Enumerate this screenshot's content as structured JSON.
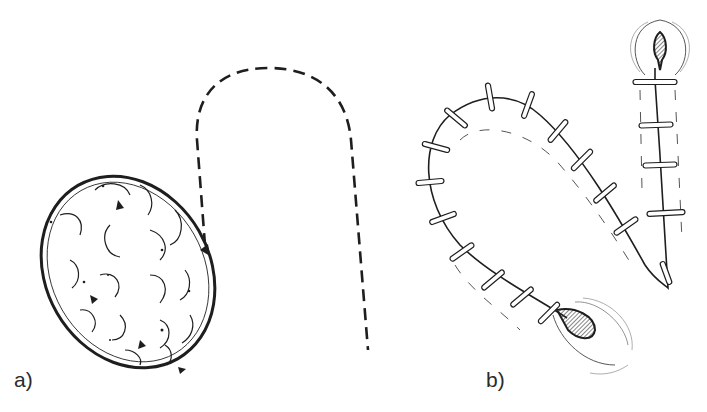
{
  "figure": {
    "panels": [
      {
        "id": "a",
        "label": "a)",
        "description": "Oval cyst/lesion with lobulated texture beside a dashed U-shaped incision outline"
      },
      {
        "id": "b",
        "label": "b)",
        "description": "Closed curved incision with interrupted sutures and two drainage openings"
      }
    ],
    "suture_count_curve": 15,
    "suture_count_straight": 4,
    "colors": {
      "ink": "#1e1e1e",
      "background": "#ffffff",
      "hatch": "#333333"
    }
  }
}
